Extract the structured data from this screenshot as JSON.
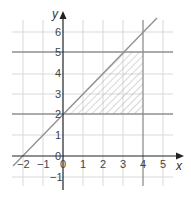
{
  "axes": {
    "x_label": "x",
    "y_label": "y",
    "x_ticks": [
      "−2",
      "−1",
      "0",
      "1",
      "2",
      "3",
      "4",
      "5"
    ],
    "y_ticks": [
      "−1",
      "0",
      "1",
      "2",
      "3",
      "4",
      "5",
      "6"
    ]
  },
  "lines": [
    {
      "name": "y = x + 2",
      "equation": "y=x+2"
    },
    {
      "name": "y = 2",
      "equation": "y=2"
    },
    {
      "name": "y = 5",
      "equation": "y=5"
    },
    {
      "name": "x = 4",
      "equation": "x=4"
    }
  ],
  "shaded_region": {
    "description": "Region bounded by y=x+2, y=2, y=5, x=4 (hatched)",
    "vertices": [
      [
        0,
        2
      ],
      [
        3,
        5
      ],
      [
        4,
        5
      ],
      [
        4,
        2
      ]
    ]
  },
  "colors": {
    "grid": "#d6d6d6",
    "lines": "#8a8a8a",
    "axes": "#222222",
    "hatch": "#a0a0a0"
  }
}
